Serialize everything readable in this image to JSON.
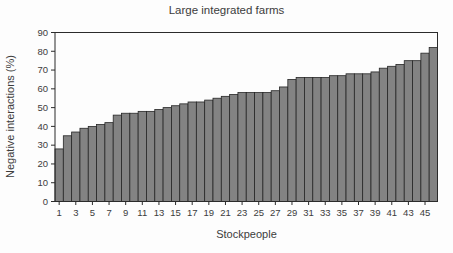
{
  "chart_data": {
    "type": "bar",
    "title": "Large integrated farms",
    "xlabel": "Stockpeople",
    "ylabel": "Negative interactions (%)",
    "ylim": [
      0,
      90
    ],
    "yticks": [
      0,
      10,
      20,
      30,
      40,
      50,
      60,
      70,
      80,
      90
    ],
    "xtick_labels": [
      1,
      3,
      5,
      7,
      9,
      11,
      13,
      15,
      17,
      19,
      21,
      23,
      25,
      27,
      29,
      31,
      33,
      35,
      37,
      39,
      41,
      43,
      45
    ],
    "x": [
      1,
      2,
      3,
      4,
      5,
      6,
      7,
      8,
      9,
      10,
      11,
      12,
      13,
      14,
      15,
      16,
      17,
      18,
      19,
      20,
      21,
      22,
      23,
      24,
      25,
      26,
      27,
      28,
      29,
      30,
      31,
      32,
      33,
      34,
      35,
      36,
      37,
      38,
      39,
      40,
      41,
      42,
      43,
      44,
      45,
      46
    ],
    "values": [
      28,
      35,
      37,
      39,
      40,
      41,
      42,
      46,
      47,
      47,
      48,
      48,
      49,
      50,
      51,
      52,
      53,
      53,
      54,
      55,
      56,
      57,
      58,
      58,
      58,
      58,
      59,
      61,
      65,
      66,
      66,
      66,
      66,
      67,
      67,
      68,
      68,
      68,
      69,
      71,
      72,
      73,
      75,
      75,
      79,
      82
    ],
    "grid": false,
    "legend": null,
    "colors": {
      "bar_fill": "#838383",
      "bar_stroke": "#262626",
      "axis": "#2b2b2b",
      "text": "#3c3c3c",
      "background": "#fdfdfd"
    }
  }
}
